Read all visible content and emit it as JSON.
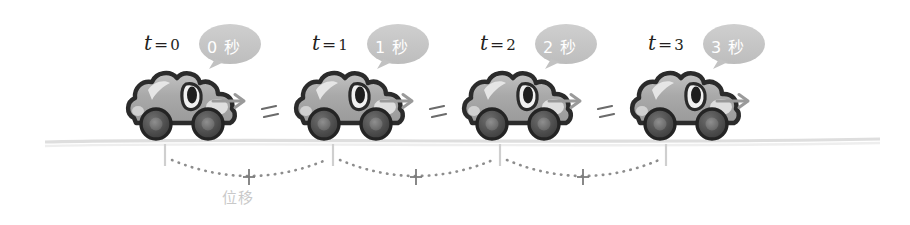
{
  "figure": {
    "caption_label": "位移",
    "caption_meaning": "displacement",
    "background_color": "#ffffff",
    "ground_line_color": "#dcdcdc",
    "car_body_color": "#a8a8a8",
    "car_outline_color": "#2b2b2b",
    "wheel_color": "#555555",
    "bubble_fill_color": "#c4c4c4",
    "bubble_text_color": "#ffffff",
    "arrow_color": "#9a9a9a",
    "dot_color": "#8d8d8d",
    "tick_color": "#cccccc",
    "label_color": "#231f20"
  },
  "frames": [
    {
      "id": "frame-0",
      "time_label_var": "t",
      "time_label_eq": "=",
      "time_label_value": "0",
      "bubble_text": "0 秒",
      "bubble_number": "0",
      "bubble_unit": "秒",
      "car_x": 120,
      "label_x": 144,
      "bubble_x": 205,
      "arrow": true,
      "motion_lines": false
    },
    {
      "id": "frame-1",
      "time_label_var": "t",
      "time_label_eq": "=",
      "time_label_value": "1",
      "bubble_text": "1 秒",
      "bubble_number": "1",
      "bubble_unit": "秒",
      "car_x": 288,
      "label_x": 312,
      "bubble_x": 373,
      "arrow": true,
      "motion_lines": true
    },
    {
      "id": "frame-2",
      "time_label_var": "t",
      "time_label_eq": "=",
      "time_label_value": "2",
      "bubble_text": "2 秒",
      "bubble_number": "2",
      "bubble_unit": "秒",
      "car_x": 456,
      "label_x": 480,
      "bubble_x": 541,
      "arrow": true,
      "motion_lines": true
    },
    {
      "id": "frame-3",
      "time_label_var": "t",
      "time_label_eq": "=",
      "time_label_value": "3",
      "bubble_text": "3 秒",
      "bubble_number": "3",
      "bubble_unit": "秒",
      "car_x": 624,
      "label_x": 648,
      "bubble_x": 709,
      "arrow": true,
      "motion_lines": true
    }
  ],
  "measurement": {
    "tick_positions": [
      165,
      333,
      500,
      666
    ],
    "segments": [
      {
        "from": 165,
        "to": 333,
        "marker": "+"
      },
      {
        "from": 333,
        "to": 500,
        "marker": "+"
      },
      {
        "from": 500,
        "to": 666,
        "marker": "+"
      }
    ],
    "caption": "位移",
    "caption_x": 222,
    "caption_y": 186
  },
  "ground": {
    "start_x": 45,
    "end_x": 880,
    "y": 141
  }
}
